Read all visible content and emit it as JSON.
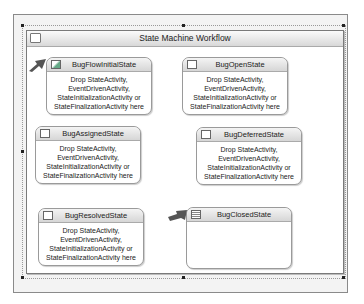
{
  "workflow": {
    "title": "State Machine Workflow",
    "icon": "workflow-icon"
  },
  "states": [
    {
      "name": "BugFlowInitialState",
      "icon": "initial-state-icon",
      "body": [
        "Drop StateActivity,",
        "EventDrivenActivity,",
        "StateInitializationActivity or",
        "StateFinalizationActivity here"
      ]
    },
    {
      "name": "BugOpenState",
      "icon": "state-icon",
      "body": [
        "Drop StateActivity,",
        "EventDrivenActivity,",
        "StateInitializationActivity or",
        "StateFinalizationActivity here"
      ]
    },
    {
      "name": "BugAssignedState",
      "icon": "state-icon",
      "body": [
        "Drop StateActivity,",
        "EventDrivenActivity,",
        "StateInitializationActivity or",
        "StateFinalizationActivity here"
      ]
    },
    {
      "name": "BugDeferredState",
      "icon": "state-icon",
      "body": [
        "Drop StateActivity,",
        "EventDrivenActivity,",
        "StateInitializationActivity or",
        "StateFinalizationActivity here"
      ]
    },
    {
      "name": "BugResolvedState",
      "icon": "state-icon",
      "body": [
        "Drop StateActivity,",
        "EventDrivenActivity,",
        "StateInitializationActivity or",
        "StateFinalizationActivity here"
      ]
    },
    {
      "name": "BugClosedState",
      "icon": "completed-state-icon",
      "body": []
    }
  ]
}
